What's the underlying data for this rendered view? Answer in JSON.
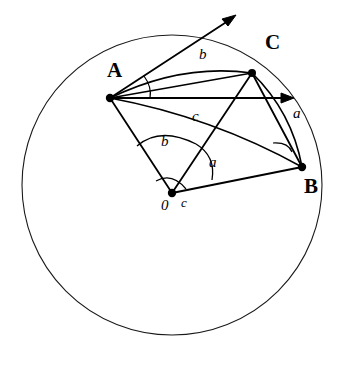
{
  "figure": {
    "type": "geometry-diagram",
    "width": 343,
    "height": 365,
    "background_color": "#ffffff",
    "stroke_color": "#000000"
  },
  "sphere": {
    "name": "sphere-outline",
    "center": {
      "x": 172,
      "y": 185
    },
    "radius": 150,
    "stroke_color": "#1a1a1a",
    "stroke_width": 1.1,
    "fill": "none"
  },
  "vertices": [
    {
      "id": "A",
      "label": "A",
      "point": {
        "x": 110,
        "y": 98
      },
      "label_pos": {
        "x": 107,
        "y": 60
      },
      "dot_radius": 4.2
    },
    {
      "id": "C",
      "label": "C",
      "point": {
        "x": 252,
        "y": 73
      },
      "label_pos": {
        "x": 265,
        "y": 32
      },
      "dot_radius": 4.0
    },
    {
      "id": "B",
      "label": "B",
      "point": {
        "x": 302,
        "y": 167
      },
      "label_pos": {
        "x": 304,
        "y": 176
      },
      "dot_radius": 4.2
    },
    {
      "id": "O",
      "label": "0",
      "point": {
        "x": 172,
        "y": 193
      },
      "label_pos": {
        "x": 161,
        "y": 198
      },
      "dot_radius": 4.2
    }
  ],
  "arc_side_labels": [
    {
      "id": "arc-b",
      "label": "b",
      "pos": {
        "x": 199,
        "y": 47
      }
    },
    {
      "id": "arc-c",
      "label": "c",
      "pos": {
        "x": 192,
        "y": 109
      }
    },
    {
      "id": "arc-a",
      "label": "a",
      "pos": {
        "x": 293,
        "y": 106
      }
    }
  ],
  "central_angle_labels": [
    {
      "id": "central-b",
      "label": "b",
      "pos": {
        "x": 161,
        "y": 134
      }
    },
    {
      "id": "central-a",
      "label": "a",
      "pos": {
        "x": 209,
        "y": 155
      }
    },
    {
      "id": "central-c",
      "label": "c",
      "pos": {
        "x": 181,
        "y": 196
      }
    }
  ],
  "radii": [
    {
      "id": "radius-OA",
      "from": "O",
      "to": "A"
    },
    {
      "id": "radius-OB",
      "from": "O",
      "to": "B"
    },
    {
      "id": "radius-OC",
      "from": "O",
      "to": "C"
    }
  ],
  "chords": [
    {
      "id": "chord-AC",
      "from": "A",
      "to": "C"
    },
    {
      "id": "chord-CB",
      "from": "C",
      "to": "B"
    }
  ],
  "tangent_rays": [
    {
      "id": "tangent-ray-AC",
      "from": {
        "x": 110,
        "y": 98
      },
      "to": {
        "x": 235,
        "y": 16
      },
      "label": "b",
      "description": "tangent ray at A toward C"
    },
    {
      "id": "tangent-ray-AB",
      "from": {
        "x": 110,
        "y": 98
      },
      "to": {
        "x": 293,
        "y": 98
      },
      "label": "a",
      "description": "tangent ray at A toward B"
    }
  ],
  "great_circle_arcs": [
    {
      "id": "great-arc-AC",
      "from": "A",
      "to": "C",
      "bulge": "up"
    },
    {
      "id": "great-arc-AB",
      "from": "A",
      "to": "B",
      "bulge": "down"
    },
    {
      "id": "great-arc-CB",
      "from": "C",
      "to": "B",
      "bulge": "right"
    }
  ],
  "angle_marks": [
    {
      "id": "angle-at-A",
      "vertex": "A",
      "description": "angle between tangent rays at A"
    },
    {
      "id": "angle-at-B",
      "vertex": "B",
      "description": "angle mark at vertex B"
    },
    {
      "id": "angle-at-O-outer",
      "vertex": "O",
      "description": "central angle b between OA and OC"
    },
    {
      "id": "angle-at-O-inner",
      "vertex": "O",
      "description": "central angle a between OC and OB"
    },
    {
      "id": "angle-at-O-small",
      "vertex": "O",
      "description": "central angle c between OA and OB"
    }
  ]
}
